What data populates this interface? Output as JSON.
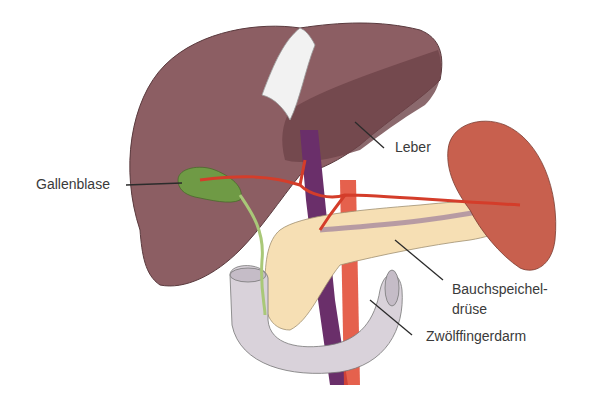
{
  "labels": {
    "gallbladder": "Gallenblase",
    "liver": "Leber",
    "pancreas_line1": "Bauchspeichel-",
    "pancreas_line2": "drüse",
    "duodenum": "Zwölffingerdarm"
  },
  "colors": {
    "liver": "#8c5e63",
    "liver_dark": "#6e4449",
    "gallbladder": "#6f9a45",
    "spleen": "#c8604e",
    "pancreas": "#f6dfb4",
    "duodenum": "#d9d2da",
    "artery": "#e0452e",
    "vein": "#6a2f6a",
    "ligament": "#f2f2f2",
    "leader_line": "#2b2b2b"
  }
}
